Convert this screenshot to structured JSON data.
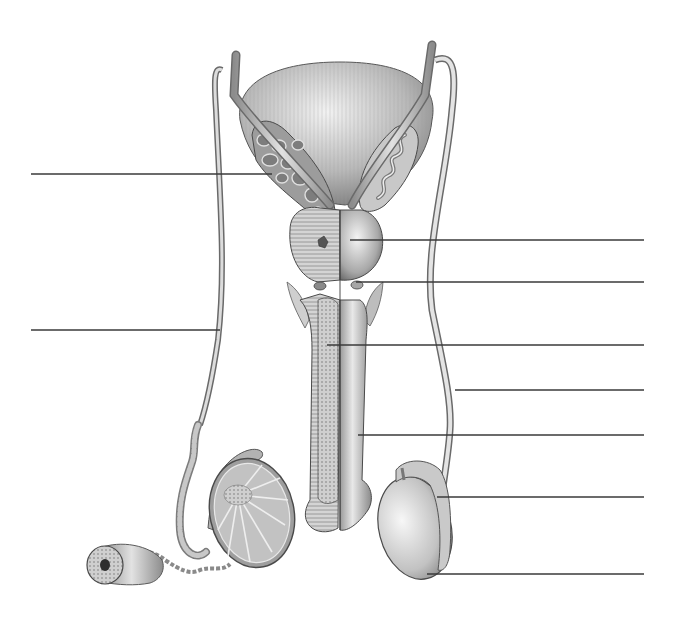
{
  "diagram": {
    "style": "grayscale pencil anatomical illustration with unlabeled leader lines",
    "colors": {
      "background": "#ffffff",
      "line": "#3a3a3a",
      "tissue_light": "#e6e6e6",
      "tissue_mid": "#b5b5b5",
      "tissue_dark": "#6e6e6e"
    },
    "leader_lines": [
      {
        "id": "left-1",
        "side": "left",
        "y": 174,
        "x1": 31,
        "x2": 272
      },
      {
        "id": "left-2",
        "side": "left",
        "y": 330,
        "x1": 31,
        "x2": 220
      },
      {
        "id": "right-1",
        "side": "right",
        "y": 240,
        "x1": 350,
        "x2": 644
      },
      {
        "id": "right-2",
        "side": "right",
        "y": 282,
        "x1": 356,
        "x2": 644
      },
      {
        "id": "right-3",
        "side": "right",
        "y": 345,
        "x1": 327,
        "x2": 644
      },
      {
        "id": "right-4",
        "side": "right",
        "y": 390,
        "x1": 455,
        "x2": 644
      },
      {
        "id": "right-5",
        "side": "right",
        "y": 435,
        "x1": 358,
        "x2": 644
      },
      {
        "id": "right-6",
        "side": "right",
        "y": 497,
        "x1": 437,
        "x2": 644
      },
      {
        "id": "right-7",
        "side": "right",
        "y": 574,
        "x1": 427,
        "x2": 644
      }
    ],
    "labels": []
  }
}
